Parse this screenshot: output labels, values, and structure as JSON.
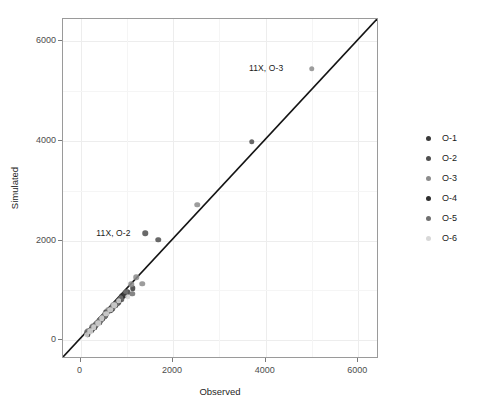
{
  "chart_data": {
    "type": "scatter",
    "title": "",
    "xlabel": "Observed",
    "ylabel": "Simulated",
    "xlim": [
      -380,
      6450
    ],
    "ylim": [
      -380,
      6450
    ],
    "xticks": [
      0,
      2000,
      4000,
      6000
    ],
    "yticks": [
      0,
      2000,
      4000,
      6000
    ],
    "xticklabels": [
      "0",
      "2000",
      "4000",
      "6000"
    ],
    "yticklabels": [
      "0",
      "2000",
      "4000",
      "6000"
    ],
    "grid": true,
    "legend_position": "right",
    "reference_line": {
      "name": "identity-line",
      "type": "1:1 line",
      "from": [
        -380,
        -380
      ],
      "to": [
        6450,
        6450
      ],
      "color": "#141414"
    },
    "annotations": [
      {
        "text": "11X, O-3",
        "x": 4380,
        "y": 5460,
        "anchor": "right-of-text"
      },
      {
        "text": "11X, O-2",
        "x": 1080,
        "y": 2160,
        "anchor": "right-of-text"
      }
    ],
    "series": [
      {
        "name": "O-1",
        "color": "#3a3a3a",
        "points": [
          [
            160,
            130
          ],
          [
            240,
            215
          ],
          [
            300,
            250
          ],
          [
            350,
            330
          ],
          [
            420,
            395
          ],
          [
            470,
            450
          ],
          [
            520,
            470
          ],
          [
            560,
            560
          ],
          [
            640,
            600
          ],
          [
            720,
            690
          ],
          [
            810,
            760
          ],
          [
            900,
            880
          ],
          [
            1010,
            960
          ],
          [
            1130,
            1040
          ]
        ]
      },
      {
        "name": "O-2",
        "color": "#4f4f4f",
        "points": [
          [
            140,
            160
          ],
          [
            260,
            230
          ],
          [
            330,
            300
          ],
          [
            390,
            360
          ],
          [
            450,
            420
          ],
          [
            540,
            500
          ],
          [
            610,
            590
          ],
          [
            700,
            640
          ],
          [
            790,
            740
          ],
          [
            880,
            820
          ],
          [
            1400,
            2150
          ],
          [
            1680,
            2020
          ],
          [
            3700,
            3980
          ]
        ]
      },
      {
        "name": "O-3",
        "color": "#8c8c8c",
        "points": [
          [
            190,
            170
          ],
          [
            270,
            290
          ],
          [
            360,
            340
          ],
          [
            430,
            410
          ],
          [
            520,
            520
          ],
          [
            600,
            610
          ],
          [
            700,
            700
          ],
          [
            820,
            800
          ],
          [
            960,
            930
          ],
          [
            1090,
            1120
          ],
          [
            1200,
            1260
          ],
          [
            1330,
            1130
          ],
          [
            2520,
            2720
          ],
          [
            5000,
            5450
          ]
        ]
      },
      {
        "name": "O-4",
        "color": "#2e2e2e",
        "points": [
          [
            150,
            120
          ],
          [
            230,
            200
          ],
          [
            310,
            280
          ],
          [
            400,
            350
          ],
          [
            480,
            430
          ],
          [
            570,
            540
          ],
          [
            660,
            620
          ],
          [
            750,
            700
          ],
          [
            840,
            810
          ],
          [
            940,
            900
          ]
        ]
      },
      {
        "name": "O-5",
        "color": "#707070",
        "points": [
          [
            170,
            190
          ],
          [
            250,
            260
          ],
          [
            340,
            320
          ],
          [
            420,
            400
          ],
          [
            510,
            480
          ],
          [
            590,
            570
          ],
          [
            680,
            650
          ],
          [
            770,
            730
          ],
          [
            870,
            850
          ],
          [
            980,
            970
          ],
          [
            1120,
            930
          ]
        ]
      },
      {
        "name": "O-6",
        "color": "#d8d8d8",
        "points": [
          [
            130,
            110
          ],
          [
            210,
            180
          ],
          [
            290,
            260
          ],
          [
            380,
            340
          ],
          [
            460,
            440
          ],
          [
            550,
            530
          ],
          [
            640,
            610
          ],
          [
            730,
            700
          ],
          [
            830,
            790
          ],
          [
            1020,
            870
          ]
        ]
      }
    ]
  },
  "legend": {
    "entries": [
      {
        "label": "O-1",
        "color": "#3a3a3a"
      },
      {
        "label": "O-2",
        "color": "#4f4f4f"
      },
      {
        "label": "O-3",
        "color": "#8c8c8c"
      },
      {
        "label": "O-4",
        "color": "#2e2e2e"
      },
      {
        "label": "O-5",
        "color": "#707070"
      },
      {
        "label": "O-6",
        "color": "#d8d8d8"
      }
    ]
  }
}
